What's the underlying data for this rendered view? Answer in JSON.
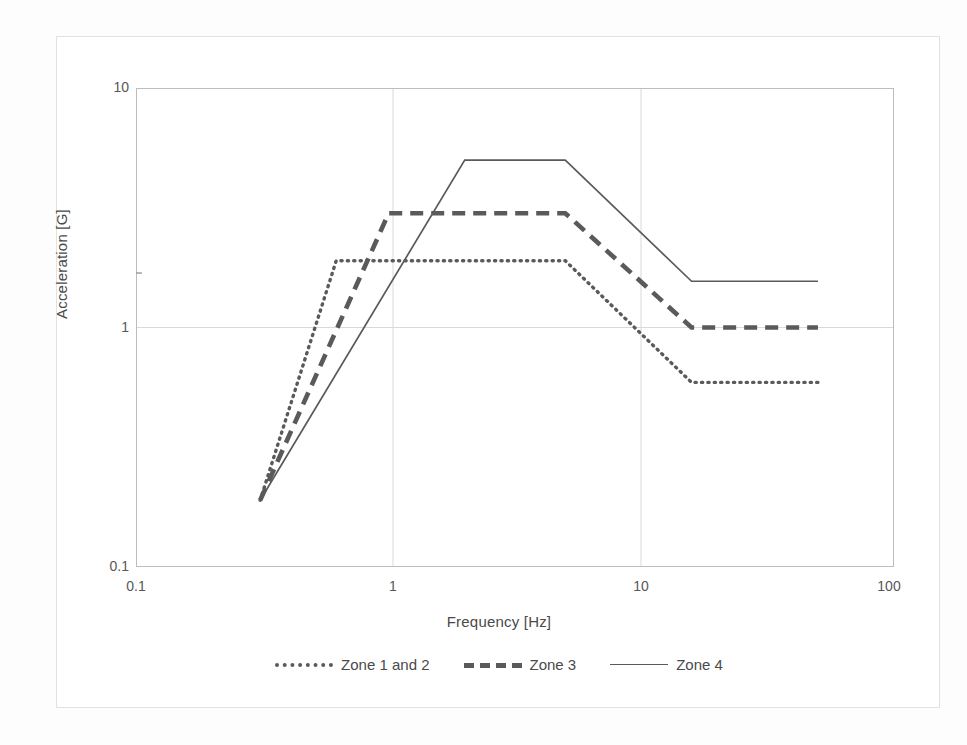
{
  "chart_data": {
    "type": "line",
    "title": "",
    "xlabel": "Frequency [Hz]",
    "ylabel": "Acceleration [G]",
    "xscale": "log",
    "yscale": "log",
    "xlim": [
      0.1,
      100
    ],
    "ylim": [
      0.1,
      10
    ],
    "xticks": [
      "0.1",
      "1",
      "10",
      "100"
    ],
    "xtick_values": [
      0.1,
      1,
      10,
      100
    ],
    "yticks": [
      "0.1",
      "1",
      "10"
    ],
    "ytick_values": [
      0.1,
      1,
      10
    ],
    "grid": true,
    "grid_style": "major gridlines at decades",
    "legend_position": "bottom-center",
    "series": [
      {
        "name": "Zone 1 and 2",
        "style": "dotted",
        "color": "#5a5a5a",
        "x": [
          0.31,
          0.62,
          5.0,
          15.8,
          50.0
        ],
        "y": [
          0.19,
          1.9,
          1.9,
          0.59,
          0.59
        ]
      },
      {
        "name": "Zone 3",
        "style": "dashed",
        "color": "#5a5a5a",
        "x": [
          0.31,
          1.0,
          5.0,
          15.8,
          50.0
        ],
        "y": [
          0.19,
          3.0,
          3.0,
          1.0,
          1.0
        ]
      },
      {
        "name": "Zone 4",
        "style": "solid",
        "color": "#5a5a5a",
        "x": [
          0.31,
          2.0,
          5.0,
          15.8,
          50.0
        ],
        "y": [
          0.19,
          5.0,
          5.0,
          1.56,
          1.56
        ]
      }
    ]
  },
  "axes": {
    "y_title": "Acceleration [G]",
    "x_title": "Frequency [Hz]",
    "y_labels": [
      "10",
      "1",
      "0.1"
    ],
    "x_labels": [
      "0.1",
      "1",
      "10",
      "100"
    ]
  },
  "legend": {
    "items": [
      {
        "label": "Zone 1 and 2",
        "style": "dotted"
      },
      {
        "label": "Zone 3",
        "style": "dashed"
      },
      {
        "label": "Zone 4",
        "style": "solid"
      }
    ]
  },
  "colors": {
    "line": "#5a5a5a",
    "axis": "#bdbdbd",
    "grid": "#d9d9d9",
    "text": "#4a4a4a",
    "frame": "#e2e2e2",
    "background": "#ffffff"
  }
}
